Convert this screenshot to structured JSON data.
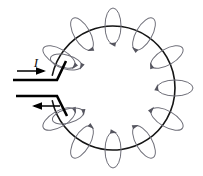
{
  "figure": {
    "width": 203,
    "height": 176,
    "background_color": "#FFFFFF"
  },
  "colors": {
    "wire": "#151515",
    "lead": "#000000",
    "field_line": "#6E6E78",
    "field_arrow": "#55555F",
    "label": "#111111"
  },
  "labels": {
    "current": "I"
  },
  "loop": {
    "center_x": 113,
    "center_y": 88,
    "radius": 62,
    "stroke_width": 1.6,
    "gap_start_deg": 168,
    "gap_end_deg": 192
  },
  "leads": {
    "top": {
      "name": "current-in-lead",
      "path": "M 13 80 L 57 80 L 66 61",
      "stroke_width": 2.6,
      "arrow": {
        "name": "current-in-arrow",
        "shaft": "M 17 71 L 44 71",
        "head": "46,71 36,67.2 36,74.8"
      }
    },
    "bottom": {
      "name": "current-out-lead",
      "path": "M 16 96 L 57 96 L 67 116",
      "stroke_width": 2.6,
      "arrow": {
        "name": "current-out-arrow",
        "shaft": "M 60 106 L 34 106",
        "head": "32,106 42,102.2 42,109.8"
      }
    }
  },
  "current_label_position": {
    "x": 36,
    "y": 67
  },
  "field_loops": [
    {
      "id": 1,
      "angle_deg": 270,
      "cx": 113,
      "cy": 26,
      "rx": 8,
      "ry": 18,
      "rotate": 0,
      "arrow_at": 95
    },
    {
      "id": 2,
      "angle_deg": 300,
      "cx": 144,
      "cy": 34,
      "rx": 8,
      "ry": 18,
      "rotate": 30,
      "arrow_at": 95
    },
    {
      "id": 3,
      "angle_deg": 330,
      "cx": 167,
      "cy": 57,
      "rx": 8,
      "ry": 18,
      "rotate": 60,
      "arrow_at": 95
    },
    {
      "id": 4,
      "angle_deg": 0,
      "cx": 175,
      "cy": 88,
      "rx": 8,
      "ry": 18,
      "rotate": 90,
      "arrow_at": 95
    },
    {
      "id": 5,
      "angle_deg": 30,
      "cx": 167,
      "cy": 119,
      "rx": 8,
      "ry": 18,
      "rotate": 120,
      "arrow_at": 95
    },
    {
      "id": 6,
      "angle_deg": 60,
      "cx": 144,
      "cy": 142,
      "rx": 8,
      "ry": 18,
      "rotate": 150,
      "arrow_at": 95
    },
    {
      "id": 7,
      "angle_deg": 90,
      "cx": 113,
      "cy": 150,
      "rx": 8,
      "ry": 18,
      "rotate": 180,
      "arrow_at": 95
    },
    {
      "id": 8,
      "angle_deg": 120,
      "cx": 82,
      "cy": 142,
      "rx": 8,
      "ry": 18,
      "rotate": 210,
      "arrow_at": 95
    },
    {
      "id": 9,
      "angle_deg": 150,
      "cx": 59,
      "cy": 119,
      "rx": 8,
      "ry": 18,
      "rotate": 240,
      "arrow_at": 95
    },
    {
      "id": 10,
      "angle_deg": 210,
      "cx": 59,
      "cy": 57,
      "rx": 8,
      "ry": 18,
      "rotate": 300,
      "arrow_at": 95
    },
    {
      "id": 11,
      "angle_deg": 240,
      "cx": 82,
      "cy": 34,
      "rx": 8,
      "ry": 18,
      "rotate": 330,
      "arrow_at": 95
    },
    {
      "id": 12,
      "angle_deg": 195,
      "cx": 66,
      "cy": 62,
      "rx": 7,
      "ry": 16,
      "rotate": 285,
      "arrow_at": 95
    },
    {
      "id": 13,
      "angle_deg": 165,
      "cx": 68,
      "cy": 116,
      "rx": 7,
      "ry": 16,
      "rotate": 255,
      "arrow_at": 95
    }
  ],
  "field_line_style": {
    "stroke_width": 1.0,
    "arrow_size": 3.4
  }
}
